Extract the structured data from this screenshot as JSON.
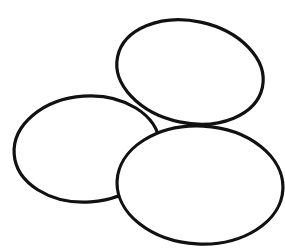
{
  "image": {
    "subject": "three eggs line drawing",
    "background": "#ffffff",
    "stroke_color": "#111111",
    "eggs": [
      {
        "name": "top-egg",
        "cx": 190,
        "cy": 72,
        "rx": 74,
        "ry": 51,
        "rotate": 12
      },
      {
        "name": "left-egg",
        "cx": 87,
        "cy": 149,
        "rx": 73,
        "ry": 53,
        "rotate": -4
      },
      {
        "name": "bottom-egg",
        "cx": 200,
        "cy": 185,
        "rx": 83,
        "ry": 59,
        "rotate": 3
      }
    ]
  }
}
